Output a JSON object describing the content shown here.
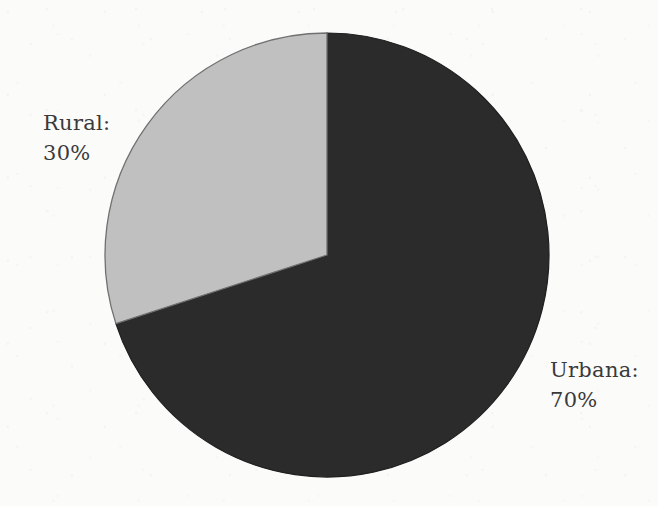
{
  "canvas": {
    "width": 658,
    "height": 506,
    "background": "#fbfbfa"
  },
  "chart_data": {
    "type": "pie",
    "title": "",
    "subtitle": "",
    "xlabel": "",
    "ylabel": "",
    "legend_position": "none",
    "grid": false,
    "start_angle_deg": 0,
    "direction": "clockwise",
    "categories": [
      "Urbana",
      "Rural"
    ],
    "values": [
      70,
      30
    ],
    "units": "%",
    "total": 100,
    "slices": [
      {
        "name": "Urbana",
        "label": "Urbana:",
        "value": 70,
        "value_text": "70%",
        "color": "#2b2b2b",
        "stroke": "#1f1f1f",
        "angle_deg": 252,
        "start_deg": 0,
        "end_deg": 252,
        "label_side": "right"
      },
      {
        "name": "Rural",
        "label": "Rural:",
        "value": 30,
        "value_text": "30%",
        "color": "#c0c0c0",
        "stroke": "#707070",
        "angle_deg": 108,
        "start_deg": 252,
        "end_deg": 360,
        "label_side": "left"
      }
    ],
    "geometry": {
      "center_x": 327,
      "center_y": 255,
      "radius": 222
    }
  },
  "labels": {
    "rural": {
      "name": "Rural:",
      "value": "30%"
    },
    "urbana": {
      "name": "Urbana:",
      "value": "70%"
    }
  },
  "colors": {
    "urbana_slice": "#2b2b2b",
    "rural_slice": "#c0c0c0",
    "outline": "#6e6e6e",
    "text": "#3a3a3a",
    "background": "#fbfbfa"
  }
}
